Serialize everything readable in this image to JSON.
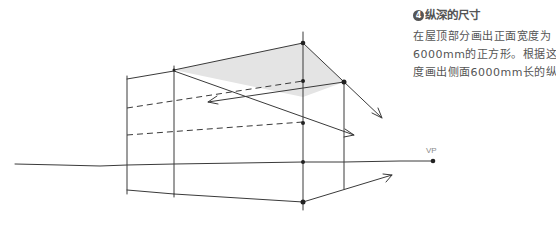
{
  "step": {
    "number": "4",
    "title": "纵深的尺寸"
  },
  "description": {
    "lines": [
      "在屋顶部分画出正面宽度为",
      "6000mm的正方形。根据这个长",
      "度画出侧面6000mm长的纵深。"
    ]
  },
  "diagram": {
    "vp_label": "VP",
    "colors": {
      "line": "#3a3a3a",
      "fill": "#e4e4e4",
      "text": "#555555",
      "label": "#8a8a8a"
    }
  }
}
